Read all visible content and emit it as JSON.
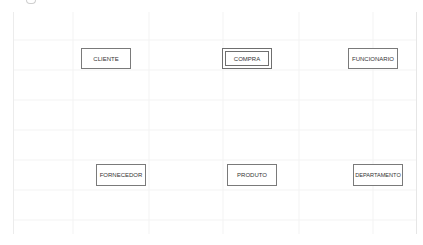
{
  "diagram": {
    "type": "er-diagram",
    "entities": [
      {
        "id": "cliente",
        "label": "CLIENTE",
        "kind": "strong"
      },
      {
        "id": "compra",
        "label": "COMPRA",
        "kind": "weak"
      },
      {
        "id": "funcionario",
        "label": "FUNCIONARIO",
        "kind": "strong"
      },
      {
        "id": "fornecedor",
        "label": "FORNECEDOR",
        "kind": "strong"
      },
      {
        "id": "produto",
        "label": "PRODUTO",
        "kind": "strong"
      },
      {
        "id": "departamento",
        "label": "DEPARTAMENTO",
        "kind": "strong"
      }
    ],
    "relationships": []
  },
  "colors": {
    "border": "#7a7a7a",
    "text": "#333333",
    "grid": "#f2f2f2",
    "background": "#ffffff"
  }
}
